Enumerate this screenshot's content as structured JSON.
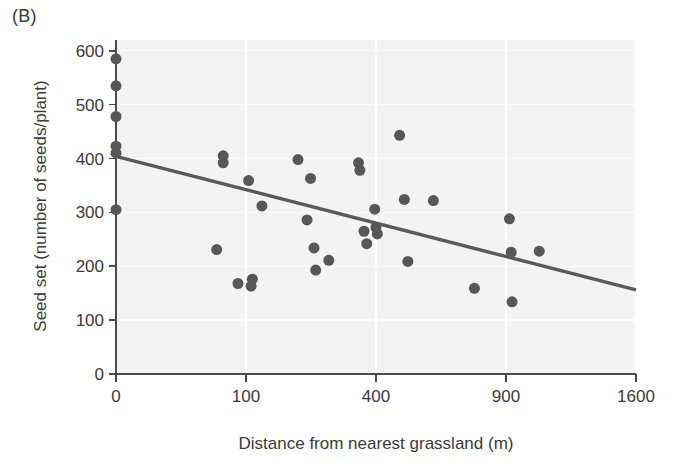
{
  "figure": {
    "panel_label": "(B)",
    "x_axis_title": "Distance from nearest grassland (m)",
    "y_axis_title": "Seed set (number of seeds/plant)"
  },
  "colors": {
    "point": "#575757",
    "trend_line": "#5a5a5a",
    "axis": "#4a4a4a",
    "plot_background": "#f3f3f3",
    "grid": "#ffffff",
    "text": "#3a3a3a",
    "page_background": "#ffffff"
  },
  "chart_data": {
    "type": "scatter",
    "title": "(B)",
    "xlabel": "Distance from nearest grassland (m)",
    "ylabel": "Seed set (number of seeds/plant)",
    "x_scale": "sqrt",
    "xlim": [
      0,
      1600
    ],
    "ylim": [
      0,
      620
    ],
    "x_ticks": [
      0,
      100,
      400,
      900,
      1600
    ],
    "x_tick_labels": [
      "0",
      "100",
      "400",
      "900",
      "1600"
    ],
    "y_ticks": [
      0,
      100,
      200,
      300,
      400,
      500,
      600
    ],
    "y_tick_labels": [
      "0",
      "100",
      "200",
      "300",
      "400",
      "500",
      "600"
    ],
    "grid": true,
    "legend": "none",
    "series": [
      {
        "name": "Seed set observations",
        "marker": "filled-circle",
        "marker_size_px": 11,
        "color": "#575757",
        "points": [
          {
            "x": 0,
            "y": 585
          },
          {
            "x": 0,
            "y": 535
          },
          {
            "x": 0,
            "y": 478
          },
          {
            "x": 0,
            "y": 423
          },
          {
            "x": 0,
            "y": 410
          },
          {
            "x": 0,
            "y": 305
          },
          {
            "x": 60,
            "y": 231
          },
          {
            "x": 68,
            "y": 405
          },
          {
            "x": 68,
            "y": 392
          },
          {
            "x": 88,
            "y": 168
          },
          {
            "x": 104,
            "y": 359
          },
          {
            "x": 108,
            "y": 163
          },
          {
            "x": 110,
            "y": 176
          },
          {
            "x": 126,
            "y": 312
          },
          {
            "x": 196,
            "y": 398
          },
          {
            "x": 216,
            "y": 286
          },
          {
            "x": 224,
            "y": 363
          },
          {
            "x": 232,
            "y": 234
          },
          {
            "x": 236,
            "y": 193
          },
          {
            "x": 268,
            "y": 211
          },
          {
            "x": 348,
            "y": 392
          },
          {
            "x": 352,
            "y": 378
          },
          {
            "x": 364,
            "y": 265
          },
          {
            "x": 372,
            "y": 242
          },
          {
            "x": 396,
            "y": 306
          },
          {
            "x": 400,
            "y": 272
          },
          {
            "x": 404,
            "y": 260
          },
          {
            "x": 476,
            "y": 443
          },
          {
            "x": 492,
            "y": 324
          },
          {
            "x": 504,
            "y": 209
          },
          {
            "x": 596,
            "y": 322
          },
          {
            "x": 760,
            "y": 159
          },
          {
            "x": 916,
            "y": 288
          },
          {
            "x": 924,
            "y": 226
          },
          {
            "x": 928,
            "y": 134
          },
          {
            "x": 1060,
            "y": 228
          }
        ]
      }
    ],
    "trend_line": {
      "type": "regression-line",
      "color": "#5a5a5a",
      "x_start": 0,
      "y_start": 404,
      "x_end": 1600,
      "y_end": 156
    }
  }
}
